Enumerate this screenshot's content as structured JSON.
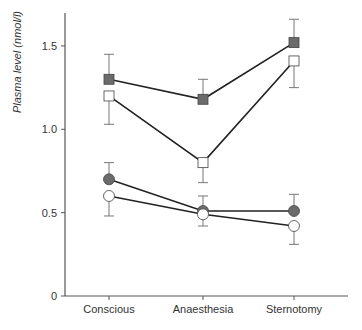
{
  "chart_data": {
    "type": "line",
    "title": "",
    "xlabel": "",
    "ylabel": "Plasma level (nmol/l)",
    "categories": [
      "Conscious",
      "Anaesthesia",
      "Sternotomy"
    ],
    "ylim": [
      0,
      1.7
    ],
    "yticks": [
      0,
      0.5,
      1.0,
      1.5
    ],
    "ytick_labels": [
      "0",
      "0.5",
      "1.0",
      "1.5"
    ],
    "grid": false,
    "legend": null,
    "series": [
      {
        "name": "filled-square",
        "marker": "square",
        "fill": "#6b6b6b",
        "values": [
          1.3,
          1.18,
          1.52
        ],
        "err_upper": [
          1.45,
          1.3,
          1.66
        ],
        "err_lower": [
          null,
          null,
          null
        ]
      },
      {
        "name": "open-square",
        "marker": "square",
        "fill": "#ffffff",
        "values": [
          1.2,
          0.8,
          1.41
        ],
        "err_upper": [
          null,
          null,
          null
        ],
        "err_lower": [
          1.03,
          0.68,
          1.25
        ]
      },
      {
        "name": "filled-circle",
        "marker": "circle",
        "fill": "#6b6b6b",
        "values": [
          0.7,
          0.51,
          0.51
        ],
        "err_upper": [
          0.8,
          0.6,
          0.61
        ],
        "err_lower": [
          null,
          null,
          null
        ]
      },
      {
        "name": "open-circle",
        "marker": "circle",
        "fill": "#ffffff",
        "values": [
          0.6,
          0.49,
          0.42
        ],
        "err_upper": [
          null,
          null,
          null
        ],
        "err_lower": [
          0.48,
          0.42,
          0.31
        ]
      }
    ]
  },
  "colors": {
    "axis": "#555555",
    "line": "#222222",
    "filled_marker": "#6b6b6b",
    "error_bar": "#777777"
  }
}
